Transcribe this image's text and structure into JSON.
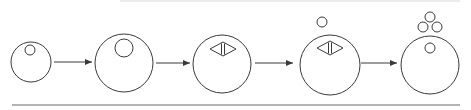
{
  "diagram": {
    "type": "process-sequence",
    "colors": {
      "stroke": "#3a3a3a",
      "background": "#ffffff",
      "rule": "#6a6a6a"
    },
    "stages": [
      {
        "index": 1,
        "cell": {
          "cx": 31,
          "cy": 62,
          "r": 20
        },
        "inner_circles": [
          {
            "cx": 30,
            "cy": 50,
            "r": 5
          }
        ],
        "spindle": null,
        "outer_circles": []
      },
      {
        "index": 2,
        "cell": {
          "cx": 124,
          "cy": 63,
          "r": 29
        },
        "inner_circles": [
          {
            "cx": 124,
            "cy": 48,
            "r": 9
          }
        ],
        "spindle": null,
        "outer_circles": []
      },
      {
        "index": 3,
        "cell": {
          "cx": 222,
          "cy": 64,
          "r": 29
        },
        "inner_circles": [],
        "spindle": {
          "cx": 223,
          "cy": 49,
          "w": 26,
          "h": 14
        },
        "outer_circles": []
      },
      {
        "index": 4,
        "cell": {
          "cx": 330,
          "cy": 65,
          "r": 30
        },
        "inner_circles": [],
        "spindle": {
          "cx": 330,
          "cy": 48,
          "w": 26,
          "h": 14
        },
        "outer_circles": [
          {
            "cx": 322,
            "cy": 22,
            "r": 5
          }
        ]
      },
      {
        "index": 5,
        "cell": {
          "cx": 430,
          "cy": 65,
          "r": 29
        },
        "inner_circles": [
          {
            "cx": 430,
            "cy": 48,
            "r": 5
          }
        ],
        "spindle": null,
        "outer_circles": [
          {
            "cx": 430,
            "cy": 17,
            "r": 5
          },
          {
            "cx": 423,
            "cy": 27,
            "r": 5
          },
          {
            "cx": 437,
            "cy": 27,
            "r": 5
          }
        ]
      }
    ],
    "arrows": [
      {
        "x1": 54,
        "x2": 92,
        "y": 62
      },
      {
        "x1": 156,
        "x2": 190,
        "y": 63
      },
      {
        "x1": 255,
        "x2": 293,
        "y": 63
      },
      {
        "x1": 361,
        "x2": 397,
        "y": 63
      }
    ],
    "rules": {
      "top": {
        "x1": 120,
        "x2": 460,
        "y": 1
      },
      "bottom": {
        "x1": 12,
        "x2": 460,
        "y": 105
      }
    }
  }
}
